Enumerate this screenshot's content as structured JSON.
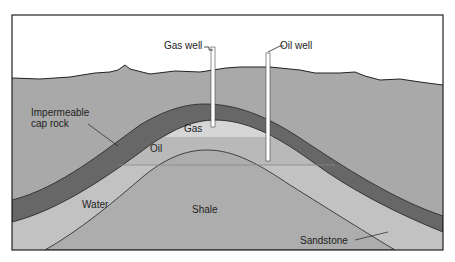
{
  "labels": {
    "gas_well": "Gas well",
    "oil_well": "Oil well",
    "cap_rock_line1": "Impermeable",
    "cap_rock_line2": "cap rock",
    "gas": "Gas",
    "oil": "Oil",
    "water": "Water",
    "shale": "Shale",
    "sandstone": "Sandstone"
  },
  "colors": {
    "sky": "#ffffff",
    "ground": "#a9a9a9",
    "cap_rock": "#676767",
    "gas": "#d6d6d6",
    "oil": "#b9b9b9",
    "water": "#c2c2c2",
    "shale": "#adadad",
    "line": "#222222"
  }
}
